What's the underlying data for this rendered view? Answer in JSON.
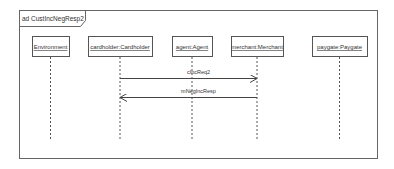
{
  "diagram": {
    "title": "ad CustIncNegResp2",
    "lifelines": [
      {
        "label": "Environment"
      },
      {
        "label": "cardholder:Cardholder"
      },
      {
        "label": "agent:Agent"
      },
      {
        "label": "merchant:Merchant"
      },
      {
        "label": "paygate:Paygate"
      }
    ],
    "messages": [
      {
        "label": "cIncReq2",
        "from": 1,
        "to": 3
      },
      {
        "label": "mNegIncResp",
        "from": 3,
        "to": 1
      }
    ]
  }
}
